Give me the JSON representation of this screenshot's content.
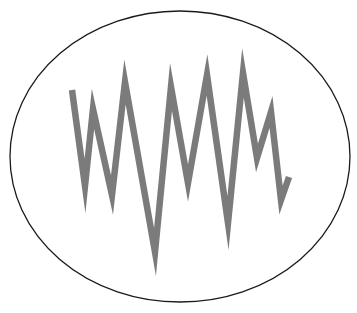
{
  "figure": {
    "width": 357,
    "height": 313,
    "background": "#ffffff",
    "ellipse": {
      "cx": 180,
      "cy": 156.5,
      "rx": 170,
      "ry": 145.5,
      "stroke": "#1a1a1a",
      "stroke_width": 1.3
    },
    "zigzag": {
      "stroke": "#7b7b7b",
      "stroke_width": 6.5,
      "points": [
        [
          72,
          90
        ],
        [
          85,
          186
        ],
        [
          93,
          109
        ],
        [
          112,
          195
        ],
        [
          125,
          82
        ],
        [
          155,
          252
        ],
        [
          171,
          87
        ],
        [
          188,
          183
        ],
        [
          207,
          75
        ],
        [
          228,
          223
        ],
        [
          243,
          73
        ],
        [
          257,
          158
        ],
        [
          271,
          112
        ],
        [
          281,
          200
        ],
        [
          289,
          177
        ]
      ]
    }
  }
}
